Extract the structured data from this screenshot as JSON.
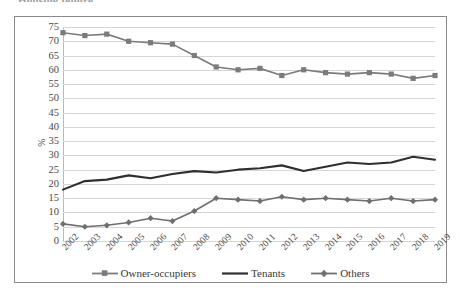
{
  "figure": {
    "title_cropped": "Housing tenure",
    "frame_visible": true
  },
  "legend": {
    "position": "bottom",
    "items": [
      {
        "label": "Owner-occupiers",
        "color": "#7b7b7b",
        "marker": "square"
      },
      {
        "label": "Tenants",
        "color": "#2f2f2f",
        "marker": "none"
      },
      {
        "label": "Others",
        "color": "#6f6f6f",
        "marker": "diamond"
      }
    ]
  },
  "chart_data": {
    "type": "line",
    "title": "",
    "xlabel": "",
    "ylabel": "%",
    "ylim": [
      0,
      75
    ],
    "ytick_step": 5,
    "yticks": [
      0,
      5,
      10,
      15,
      20,
      25,
      30,
      35,
      40,
      45,
      50,
      55,
      60,
      65,
      70,
      75
    ],
    "grid": true,
    "grid_axis": "y",
    "legend_position": "bottom",
    "categories": [
      "2002",
      "2003",
      "2004",
      "2005",
      "2006",
      "2007",
      "2008",
      "2009",
      "2010",
      "2011",
      "2012",
      "2013",
      "2014",
      "2015",
      "2016",
      "2017",
      "2018",
      "2019"
    ],
    "series": [
      {
        "name": "Owner-occupiers",
        "color": "#7b7b7b",
        "marker": "square",
        "values": [
          73.0,
          72.0,
          72.5,
          70.0,
          69.5,
          69.0,
          65.0,
          61.0,
          60.0,
          60.5,
          58.0,
          60.0,
          59.0,
          58.5,
          59.0,
          58.5,
          57.0,
          58.0
        ]
      },
      {
        "name": "Tenants",
        "color": "#2f2f2f",
        "marker": "none",
        "values": [
          18.0,
          21.0,
          21.5,
          23.0,
          22.0,
          23.5,
          24.5,
          24.0,
          25.0,
          25.5,
          26.5,
          24.5,
          26.0,
          27.5,
          27.0,
          27.5,
          29.5,
          28.5
        ]
      },
      {
        "name": "Others",
        "color": "#6f6f6f",
        "marker": "diamond",
        "values": [
          6.0,
          5.0,
          5.5,
          6.5,
          8.0,
          7.0,
          10.5,
          15.0,
          14.5,
          14.0,
          15.5,
          14.5,
          15.0,
          14.5,
          14.0,
          15.0,
          14.0,
          14.5
        ]
      }
    ]
  }
}
